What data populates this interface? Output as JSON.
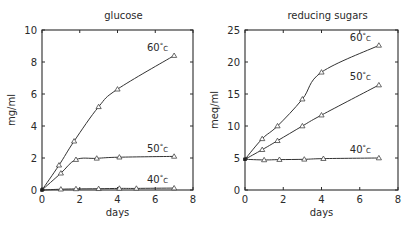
{
  "chart_data": [
    {
      "type": "line",
      "title": "glucose",
      "xlabel": "days",
      "ylabel": "mg/ml",
      "xlim": [
        0,
        8
      ],
      "ylim": [
        0,
        10
      ],
      "xticks": [
        0,
        2,
        4,
        6,
        8
      ],
      "yticks": [
        0,
        2,
        4,
        6,
        8,
        10
      ],
      "grid": false,
      "marker": "triangle",
      "frame": {
        "x0": 42,
        "x1": 193,
        "y0": 190,
        "y1": 30
      },
      "series": [
        {
          "name": "60°C",
          "label_pos": [
            7.0,
            8.7
          ],
          "x": [
            0,
            0.9,
            1.7,
            3.0,
            4.0,
            7.0
          ],
          "values": [
            0,
            1.55,
            3.05,
            5.2,
            6.3,
            8.4
          ]
        },
        {
          "name": "50°C",
          "label_pos": [
            7.0,
            2.4
          ],
          "x": [
            0,
            1.0,
            1.8,
            2.9,
            4.1,
            7.0
          ],
          "values": [
            0,
            1.05,
            1.9,
            1.98,
            2.05,
            2.1
          ]
        },
        {
          "name": "40°C",
          "label_pos": [
            7.0,
            0.45
          ],
          "x": [
            0,
            1.0,
            1.8,
            3.0,
            4.1,
            5.0,
            7.0
          ],
          "values": [
            0,
            0.05,
            0.07,
            0.08,
            0.1,
            0.1,
            0.12
          ]
        }
      ]
    },
    {
      "type": "line",
      "title": "reducing sugars",
      "xlabel": "days",
      "ylabel": "meq/ml",
      "xlim": [
        0,
        8
      ],
      "ylim": [
        0,
        25
      ],
      "xticks": [
        0,
        2,
        4,
        6,
        8
      ],
      "yticks": [
        0,
        5,
        10,
        15,
        20,
        25
      ],
      "grid": false,
      "marker": "triangle",
      "frame": {
        "x0": 245,
        "x1": 398,
        "y0": 190,
        "y1": 30
      },
      "series": [
        {
          "name": "60°C",
          "label_pos": [
            6.9,
            23.3
          ],
          "x": [
            0,
            0.9,
            1.7,
            3.0,
            4.0,
            7.0
          ],
          "values": [
            4.8,
            8.0,
            10.0,
            14.2,
            18.4,
            22.6
          ]
        },
        {
          "name": "50°C",
          "label_pos": [
            6.9,
            17.2
          ],
          "x": [
            0,
            0.9,
            1.7,
            3.0,
            4.0,
            7.0
          ],
          "values": [
            4.8,
            6.3,
            7.7,
            10.0,
            11.7,
            16.4
          ]
        },
        {
          "name": "40°C",
          "label_pos": [
            6.9,
            5.8
          ],
          "x": [
            0,
            1.0,
            1.8,
            3.1,
            4.1,
            7.0
          ],
          "values": [
            4.8,
            4.7,
            4.75,
            4.8,
            4.9,
            5.0
          ]
        }
      ]
    }
  ]
}
